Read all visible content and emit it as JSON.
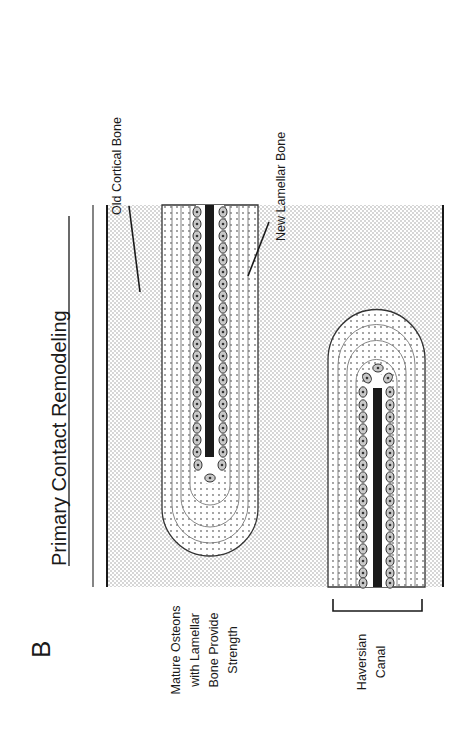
{
  "figure": {
    "panel_letter": "B",
    "title": "Primary Contact Remodeling",
    "orientation": "rotated-90-ccw"
  },
  "labels": {
    "old_cortical_bone": "Old Cortical Bone",
    "new_lamellar_bone": "New Lamellar Bone",
    "mature_osteons": [
      "Mature Osteons",
      "with Lamellar",
      "Bone Provide",
      "Strength"
    ],
    "haversian_canal": [
      "Haversian",
      "Canal"
    ]
  },
  "legend_regions": {
    "old_cortical_bone_fill": "dense dot stipple",
    "new_lamellar_bone_fill": "sparse dot lamellae",
    "osteocytes": "oval cells lining canal",
    "canal": "solid black"
  },
  "colors": {
    "ink": "#1a1a1a",
    "stipple": "#9a9a9a",
    "lamellae": "#555555",
    "canal": "#1a1a1a",
    "cell_fill": "#c8c8c8",
    "background": "#ffffff"
  }
}
